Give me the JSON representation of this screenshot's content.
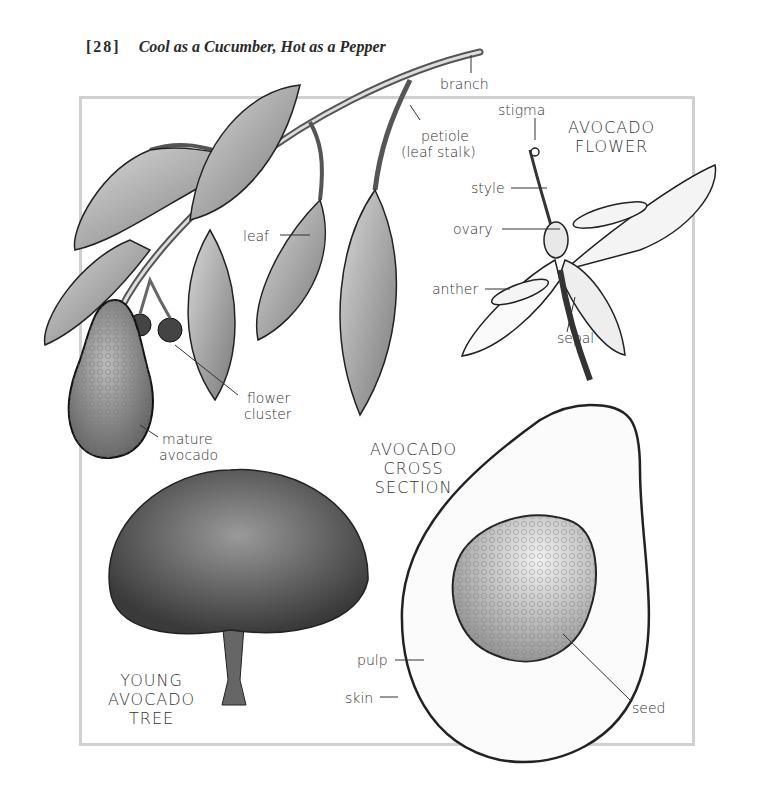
{
  "header": {
    "page_number": "[28]",
    "book_title": "Cool as a Cucumber, Hot as a Pepper"
  },
  "sections": {
    "flower_title": [
      "AVOCADO",
      "FLOWER"
    ],
    "cross_section_title": [
      "AVOCADO",
      "CROSS",
      "SECTION"
    ],
    "tree_title": [
      "YOUNG",
      "AVOCADO",
      "TREE"
    ]
  },
  "labels": {
    "branch": "branch",
    "petiole": "petiole",
    "leaf_stalk": "(leaf stalk)",
    "leaf": "leaf",
    "flower_cluster_1": "flower",
    "flower_cluster_2": "cluster",
    "mature_1": "mature",
    "mature_2": "avocado",
    "stigma": "stigma",
    "style": "style",
    "ovary": "ovary",
    "anther": "anther",
    "sepal": "sepal",
    "pulp": "pulp",
    "skin": "skin",
    "seed": "seed"
  },
  "colors": {
    "frame": "#d0d0d0",
    "ink": "#222222",
    "leaf_fill": "#a8a8a8",
    "fruit_fill": "#8c8c8c"
  }
}
